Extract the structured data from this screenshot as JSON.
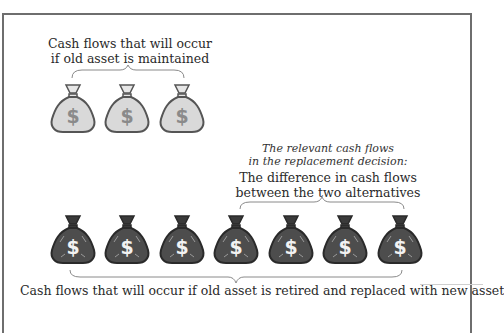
{
  "diagram": {
    "title_old": {
      "line1": "Cash flows that will occur",
      "line2": "if old asset is maintained"
    },
    "relevant": {
      "line1": "The relevant cash flows",
      "line2": "in the replacement decision:",
      "line3": "The difference in cash flows",
      "line4": "between the two alternatives"
    },
    "title_new": "Cash flows that will occur if old asset is retired and replaced with new asset",
    "old_bags": {
      "count": 3,
      "symbol": "$",
      "fill": "#d9d9d9",
      "stroke": "#555555"
    },
    "new_bags": {
      "count": 7,
      "symbol": "$",
      "fill": "#4d4d4d",
      "stroke": "#2a2a2a"
    },
    "colors": {
      "frame": "#6e6e6e",
      "text": "#2a2a2a",
      "brace": "#8a8a8a"
    }
  }
}
